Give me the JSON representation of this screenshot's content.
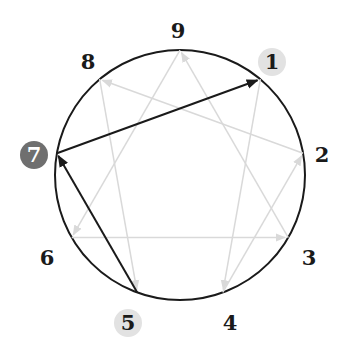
{
  "diagram": {
    "type": "enneagram",
    "colors": {
      "circle": "#1a1a1a",
      "inactive_line": "#d9d9d9",
      "active_line": "#1a1a1a",
      "highlight_light": "#e2e2e2",
      "highlight_dark": "#6f6f6f"
    },
    "points": [
      {
        "number": "9",
        "highlight": "none"
      },
      {
        "number": "1",
        "highlight": "light"
      },
      {
        "number": "2",
        "highlight": "none"
      },
      {
        "number": "3",
        "highlight": "none"
      },
      {
        "number": "4",
        "highlight": "none"
      },
      {
        "number": "5",
        "highlight": "light"
      },
      {
        "number": "6",
        "highlight": "none"
      },
      {
        "number": "7",
        "highlight": "dark"
      },
      {
        "number": "8",
        "highlight": "none"
      }
    ],
    "inactive_arrows": [
      {
        "from": "1",
        "to": "4"
      },
      {
        "from": "4",
        "to": "2"
      },
      {
        "from": "2",
        "to": "8"
      },
      {
        "from": "8",
        "to": "5"
      },
      {
        "from": "9",
        "to": "6"
      },
      {
        "from": "6",
        "to": "3"
      },
      {
        "from": "3",
        "to": "9"
      }
    ],
    "active_arrows": [
      {
        "from": "5",
        "to": "7"
      },
      {
        "from": "7",
        "to": "1"
      }
    ]
  }
}
